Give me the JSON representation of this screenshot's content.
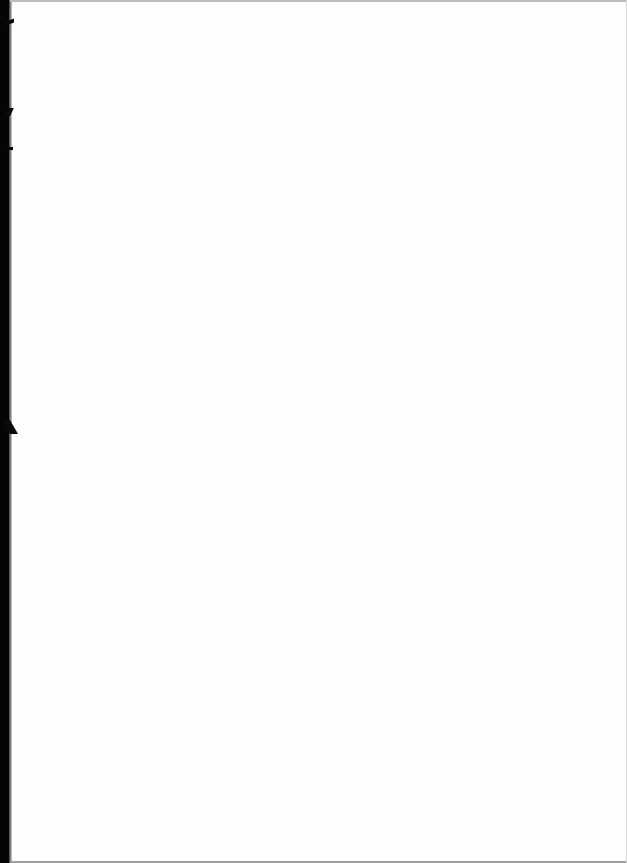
{
  "document": {
    "type": "scanned-page",
    "content": "",
    "colors": {
      "paper": "#fefefe",
      "scan_edge": "#050505",
      "border_line": "#bdbdbd"
    }
  }
}
